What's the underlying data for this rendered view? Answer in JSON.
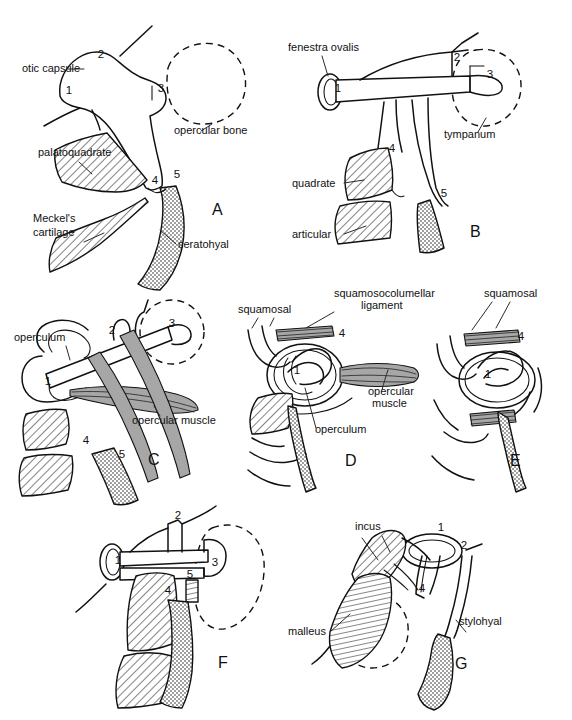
{
  "figure": {
    "background_color": "#ffffff",
    "ink_color": "#111111",
    "panel_count": 7
  },
  "legend_keys": {
    "1": "fenestra ovalis / footplate region",
    "2": "dorsal process",
    "3": "distal / tympanic end",
    "4": "quadrate-articular contact",
    "5": "ceratohyal / stylohyal attachment"
  },
  "panels": [
    {
      "id": "A",
      "letter": "A",
      "letter_x": 212,
      "letter_y": 215,
      "numbers": [
        {
          "text": "1",
          "x": 69,
          "y": 94
        },
        {
          "text": "2",
          "x": 101,
          "y": 58
        },
        {
          "text": "3",
          "x": 161,
          "y": 92
        },
        {
          "text": "4",
          "x": 155,
          "y": 184
        },
        {
          "text": "5",
          "x": 177,
          "y": 178
        }
      ],
      "labels": [
        {
          "text": "otic capsule",
          "x": 22,
          "y": 72,
          "anchor": "start"
        },
        {
          "text": "opercular bone",
          "x": 174,
          "y": 134,
          "anchor": "start"
        },
        {
          "text": "palatoquadrate",
          "x": 38,
          "y": 156,
          "anchor": "start"
        },
        {
          "text": "Meckel's",
          "x": 33,
          "y": 222,
          "anchor": "start"
        },
        {
          "text": "cartilage",
          "x": 33,
          "y": 236,
          "anchor": "start"
        },
        {
          "text": "ceratohyal",
          "x": 178,
          "y": 248,
          "anchor": "start"
        }
      ]
    },
    {
      "id": "B",
      "letter": "B",
      "letter_x": 470,
      "letter_y": 237,
      "numbers": [
        {
          "text": "1",
          "x": 338,
          "y": 92
        },
        {
          "text": "2",
          "x": 457,
          "y": 61
        },
        {
          "text": "3",
          "x": 490,
          "y": 78
        },
        {
          "text": "4",
          "x": 392,
          "y": 152
        },
        {
          "text": "5",
          "x": 444,
          "y": 197
        }
      ],
      "labels": [
        {
          "text": "fenestra ovalis",
          "x": 288,
          "y": 51,
          "anchor": "start"
        },
        {
          "text": "tympanum",
          "x": 444,
          "y": 138,
          "anchor": "start"
        },
        {
          "text": "quadrate",
          "x": 292,
          "y": 187,
          "anchor": "start"
        },
        {
          "text": "articular",
          "x": 292,
          "y": 238,
          "anchor": "start"
        }
      ]
    },
    {
      "id": "C",
      "letter": "C",
      "letter_x": 148,
      "letter_y": 465,
      "numbers": [
        {
          "text": "1",
          "x": 48,
          "y": 385
        },
        {
          "text": "2",
          "x": 112,
          "y": 334
        },
        {
          "text": "3",
          "x": 172,
          "y": 327
        },
        {
          "text": "4",
          "x": 86,
          "y": 444
        },
        {
          "text": "5",
          "x": 122,
          "y": 458
        }
      ],
      "labels": [
        {
          "text": "operculum",
          "x": 14,
          "y": 341,
          "anchor": "start"
        },
        {
          "text": "opercular muscle",
          "x": 132,
          "y": 424,
          "anchor": "start"
        }
      ]
    },
    {
      "id": "D",
      "letter": "D",
      "letter_x": 345,
      "letter_y": 466,
      "numbers": [
        {
          "text": "1",
          "x": 297,
          "y": 374
        },
        {
          "text": "4",
          "x": 342,
          "y": 337
        }
      ],
      "labels": [
        {
          "text": "squamosal",
          "x": 238,
          "y": 313,
          "anchor": "start"
        },
        {
          "text": "squamosocolumellar",
          "x": 334,
          "y": 297,
          "anchor": "start"
        },
        {
          "text": "ligament",
          "x": 361,
          "y": 309,
          "anchor": "start"
        },
        {
          "text": "opercular",
          "x": 368,
          "y": 395,
          "anchor": "start"
        },
        {
          "text": "muscle",
          "x": 372,
          "y": 407,
          "anchor": "start"
        },
        {
          "text": "operculum",
          "x": 315,
          "y": 433,
          "anchor": "start"
        }
      ]
    },
    {
      "id": "E",
      "letter": "E",
      "letter_x": 510,
      "letter_y": 466,
      "numbers": [
        {
          "text": "1",
          "x": 488,
          "y": 378
        },
        {
          "text": "4",
          "x": 521,
          "y": 340
        }
      ],
      "labels": [
        {
          "text": "squamosal",
          "x": 484,
          "y": 297,
          "anchor": "start"
        }
      ]
    },
    {
      "id": "F",
      "letter": "F",
      "letter_x": 218,
      "letter_y": 668,
      "numbers": [
        {
          "text": "1",
          "x": 118,
          "y": 564
        },
        {
          "text": "2",
          "x": 178,
          "y": 519
        },
        {
          "text": "3",
          "x": 215,
          "y": 566
        },
        {
          "text": "4",
          "x": 168,
          "y": 594
        },
        {
          "text": "5",
          "x": 190,
          "y": 578
        }
      ],
      "labels": []
    },
    {
      "id": "G",
      "letter": "G",
      "letter_x": 455,
      "letter_y": 669,
      "numbers": [
        {
          "text": "1",
          "x": 441,
          "y": 531
        },
        {
          "text": "2",
          "x": 464,
          "y": 549
        },
        {
          "text": "4",
          "x": 422,
          "y": 592
        }
      ],
      "labels": [
        {
          "text": "incus",
          "x": 355,
          "y": 530,
          "anchor": "start"
        },
        {
          "text": "stylohyal",
          "x": 459,
          "y": 625,
          "anchor": "start"
        },
        {
          "text": "malleus",
          "x": 288,
          "y": 635,
          "anchor": "start"
        }
      ]
    }
  ]
}
